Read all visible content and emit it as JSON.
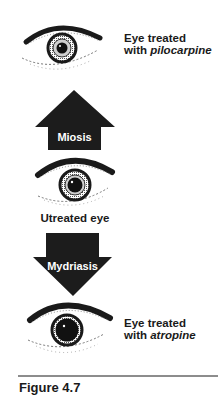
{
  "diagram": {
    "top_eye": {
      "label_line1": "Eye treated",
      "label_line2_prefix": "with ",
      "label_line2_drug": "pilocarpine",
      "pupil_state": "constricted"
    },
    "up_arrow": {
      "label": "Miosis"
    },
    "middle_eye": {
      "label": "Utreated eye",
      "pupil_state": "normal"
    },
    "down_arrow": {
      "label": "Mydriasis"
    },
    "bottom_eye": {
      "label_line1": "Eye treated",
      "label_line2_prefix": "with ",
      "label_line2_drug": "atropine",
      "pupil_state": "dilated"
    },
    "caption": "Figure 4.7"
  },
  "colors": {
    "ink": "#1a1a1a",
    "arrow_fill": "#1c1c1c",
    "arrow_text": "#ffffff",
    "background": "#ffffff"
  }
}
